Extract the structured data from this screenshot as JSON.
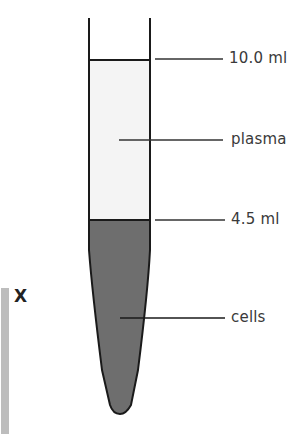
{
  "diagram": {
    "labels": {
      "top_level": "10.0 ml",
      "plasma": "plasma",
      "boundary_level": "4.5 ml",
      "cells": "cells"
    },
    "side_marker": "X",
    "colors": {
      "plasma_fill": "#f4f4f4",
      "cells_fill": "#6e6e6e",
      "outline": "#1a1a1a",
      "side_bar": "#bdbdbd"
    }
  }
}
